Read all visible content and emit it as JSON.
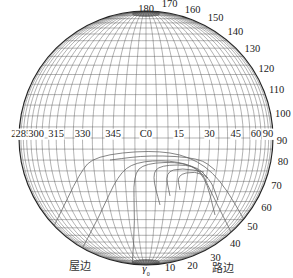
{
  "diagram": {
    "type": "isocandela polar grid (C-γ coordinate system)",
    "circle": {
      "cx": 146,
      "cy": 138,
      "r": 127,
      "stroke": "#222222"
    },
    "grid_color": "#555555",
    "curve_color": "#666666",
    "c_plane_labels": [
      "270",
      "285",
      "300",
      "315",
      "330",
      "345",
      "C0",
      "15",
      "30",
      "45",
      "60",
      "75",
      "90"
    ],
    "gamma_labels_right": [
      "180",
      "170",
      "160",
      "150",
      "140",
      "130",
      "120",
      "110",
      "100",
      "90",
      "80",
      "70",
      "60",
      "50",
      "40",
      "30",
      "20",
      "10"
    ],
    "gamma0_label": "γ",
    "gamma0_sub": "0",
    "left_side_label": "屋边",
    "right_side_label": "路边"
  }
}
